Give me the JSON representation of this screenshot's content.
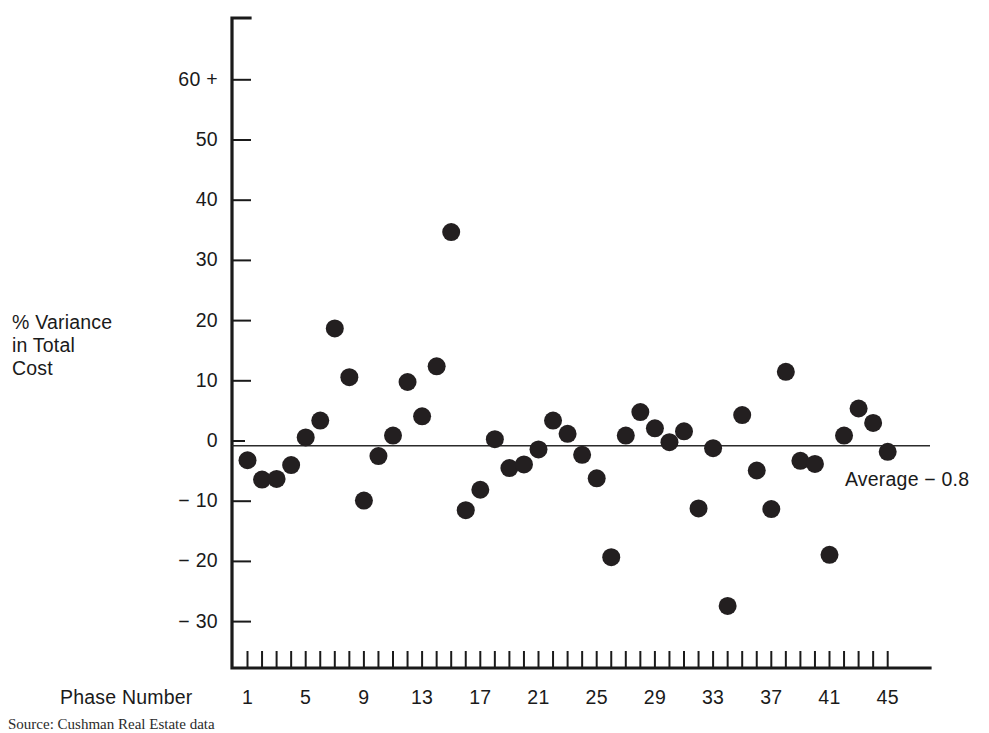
{
  "figure": {
    "y_axis_title": "% Variance\nin Total\nCost",
    "x_axis_title": "Phase Number",
    "average_annotation": "Average  − 0.8",
    "source_caption": "Source: Cushman Real Estate data"
  },
  "chart_data": {
    "type": "scatter",
    "title": "",
    "subtitle": "",
    "xlabel": "Phase Number",
    "ylabel": "% Variance in Total Cost",
    "grid": false,
    "legend": "none",
    "xlim": [
      0,
      46
    ],
    "ylim": [
      -35,
      65
    ],
    "x_ticks_major": [
      1,
      5,
      9,
      13,
      17,
      21,
      25,
      29,
      33,
      37,
      41,
      45
    ],
    "x_tick_labels": [
      "1",
      "5",
      "9",
      "13",
      "17",
      "21",
      "25",
      "29",
      "33",
      "37",
      "41",
      "45"
    ],
    "x_minor_tick_interval": 1,
    "y_ticks": [
      -30,
      -20,
      -10,
      0,
      10,
      20,
      30,
      40,
      50,
      60
    ],
    "y_tick_labels": [
      "− 30",
      "− 20",
      "− 10",
      "0",
      "10",
      "20",
      "30",
      "40",
      "50",
      "60 +"
    ],
    "annotations": [
      {
        "name": "average-line",
        "type": "hline",
        "y": -0.8,
        "label": "Average  − 0.8"
      }
    ],
    "marker": {
      "shape": "circle",
      "color": "#231f20",
      "size_px": 18
    },
    "series": [
      {
        "name": "% Variance in Total Cost",
        "x": [
          1,
          2,
          3,
          4,
          5,
          6,
          7,
          8,
          9,
          10,
          11,
          12,
          13,
          14,
          15,
          16,
          17,
          18,
          19,
          20,
          21,
          22,
          23,
          24,
          25,
          26,
          27,
          28,
          29,
          30,
          31,
          32,
          33,
          34,
          35,
          36,
          37,
          38,
          39,
          40,
          41,
          42,
          43,
          44,
          45
        ],
        "y": [
          -3.2,
          -6.4,
          -6.3,
          -4.0,
          0.6,
          3.4,
          18.7,
          10.6,
          -9.9,
          -2.5,
          0.9,
          9.8,
          4.1,
          12.4,
          34.7,
          -11.5,
          -8.1,
          0.3,
          -4.5,
          -3.9,
          -1.4,
          3.4,
          1.2,
          -2.3,
          -6.2,
          -19.3,
          0.9,
          4.8,
          2.1,
          -0.2,
          1.6,
          -11.2,
          -1.2,
          -27.4,
          4.3,
          -4.9,
          -11.3,
          11.5,
          -3.3,
          -3.8,
          -18.9,
          0.9,
          5.4,
          3.0,
          -1.8
        ]
      }
    ]
  }
}
